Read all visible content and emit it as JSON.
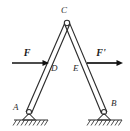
{
  "figure": {
    "kind": "statics-free-body-diagram",
    "background_color": "#ffffff",
    "ink_color": "#2e2e2e",
    "labels": {
      "apex": "C",
      "left_support": "A",
      "right_support": "B",
      "left_member_point": "D",
      "right_member_point": "E",
      "left_force": "F",
      "right_force": "F'"
    },
    "geometry": {
      "apex_point": {
        "x": 67,
        "y": 23
      },
      "left_base_point": {
        "x": 29,
        "y": 112
      },
      "right_base_point": {
        "x": 104,
        "y": 112
      },
      "ground_line_y": 120,
      "left_ground_span": {
        "x1": 14,
        "x2": 48
      },
      "right_ground_span": {
        "x1": 88,
        "x2": 122
      },
      "member_half_width": 2.6,
      "joint_radius": 2.6
    },
    "forces": [
      {
        "name": "F",
        "label": "F",
        "direction": "right",
        "applied_at": "D",
        "shaft": {
          "x1": 12,
          "x2": 49,
          "y": 63
        },
        "label_position": {
          "x": 27,
          "y": 54
        }
      },
      {
        "name": "F-prime",
        "label": "F'",
        "direction": "right",
        "applied_at": "E",
        "shaft": {
          "x1": 87,
          "x2": 123,
          "y": 63
        },
        "label_position": {
          "x": 101,
          "y": 54
        }
      }
    ],
    "supports": [
      {
        "name": "A",
        "type": "pin",
        "label_position": {
          "x": 14,
          "y": 110
        }
      },
      {
        "name": "B",
        "type": "pin",
        "label_position": {
          "x": 113,
          "y": 106
        }
      }
    ],
    "point_labels": [
      {
        "name": "C",
        "x": 64,
        "y": 13
      },
      {
        "name": "D",
        "x": 52,
        "y": 70
      },
      {
        "name": "E",
        "x": 74,
        "y": 70
      }
    ]
  }
}
